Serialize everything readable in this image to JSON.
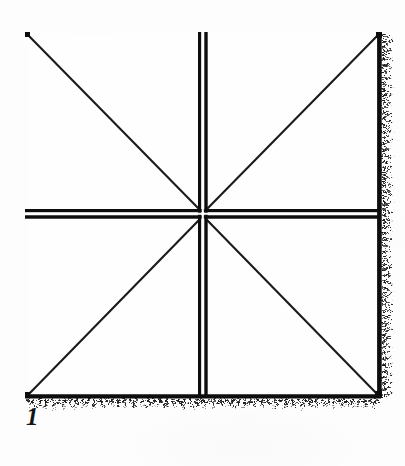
{
  "figure": {
    "caption": "1",
    "background_color": "#fdfdfd",
    "ink_color": "#111111",
    "square": {
      "left": 25,
      "top": 32,
      "right": 381,
      "bottom": 398,
      "width": 356,
      "height": 366
    },
    "center_point": {
      "x": 203,
      "y": 215
    },
    "borders": [
      {
        "name": "top-border",
        "style": "thin-solid",
        "thickness_px": 3,
        "texture": "clean"
      },
      {
        "name": "left-border",
        "style": "medium-solid",
        "thickness_px": 4,
        "texture": "clean"
      },
      {
        "name": "right-border",
        "style": "thick-solid",
        "thickness_px": 5,
        "texture": "speckled-rough-ink"
      },
      {
        "name": "bottom-border",
        "style": "thick-solid",
        "thickness_px": 5,
        "texture": "speckled-rough-ink"
      }
    ],
    "median_lines": [
      {
        "name": "horizontal-median",
        "style": "double-rule",
        "y_top_rule": 210,
        "y_bottom_rule": 217,
        "gap_px": 3
      },
      {
        "name": "vertical-median",
        "style": "double-rule",
        "x_left_rule": 199,
        "x_right_rule": 206,
        "gap_px": 3
      }
    ],
    "diagonals": [
      {
        "name": "diagonal-top-left",
        "from": "center",
        "to": "top-left-corner"
      },
      {
        "name": "diagonal-top-right",
        "from": "center",
        "to": "top-right-corner"
      },
      {
        "name": "diagonal-bottom-left",
        "from": "center",
        "to": "bottom-left-corner"
      },
      {
        "name": "diagonal-bottom-right",
        "from": "center",
        "to": "bottom-right-corner"
      }
    ],
    "quadrants": [
      {
        "name": "quadrant-top-left"
      },
      {
        "name": "quadrant-top-right"
      },
      {
        "name": "quadrant-bottom-left"
      },
      {
        "name": "quadrant-bottom-right"
      }
    ]
  }
}
